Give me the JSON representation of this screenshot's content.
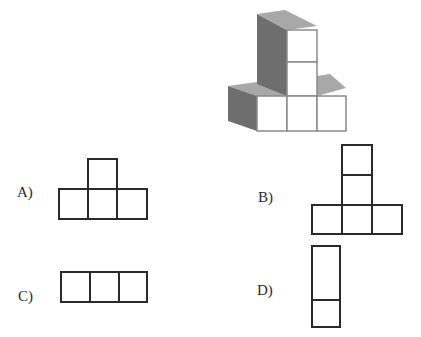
{
  "figure": {
    "colors": {
      "front_face": "#ffffff",
      "top_face": "#a8a8a8",
      "side_face": "#6e6e6e",
      "edge": "#8a8a8a"
    }
  },
  "options": [
    {
      "id": "A",
      "label": "A)",
      "shape": "T: one square above middle of a row of three"
    },
    {
      "id": "B",
      "label": "B)",
      "shape": "inverted T: two squares stacked above middle of a row of three"
    },
    {
      "id": "C",
      "label": "C)",
      "shape": "row of three squares"
    },
    {
      "id": "D",
      "label": "D)",
      "shape": "tall rectangle over a square"
    }
  ],
  "colors": {
    "outline": "#2a2a2a"
  }
}
